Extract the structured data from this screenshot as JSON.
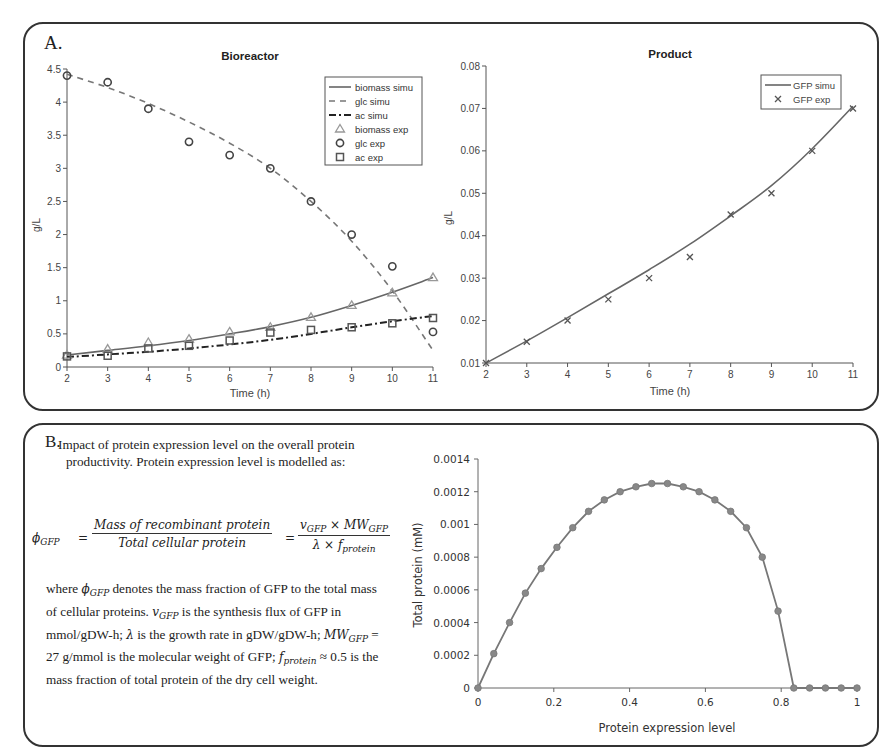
{
  "panelA": {
    "label": "A.",
    "bioreactor": {
      "title": "Bioreactor",
      "ylabel": "g/L",
      "xlabel": "Time (h)",
      "yticks": [
        "0",
        "0.5",
        "1",
        "1.5",
        "2",
        "2.5",
        "3",
        "3.5",
        "4",
        "4.5"
      ],
      "xticks": [
        "2",
        "3",
        "4",
        "5",
        "6",
        "7",
        "8",
        "9",
        "10",
        "11"
      ],
      "legend": [
        "biomass simu",
        "glc simu",
        "ac simu",
        "biomass exp",
        "glc exp",
        "ac exp"
      ]
    },
    "product": {
      "title": "Product",
      "ylabel": "g/L",
      "xlabel": "Time (h)",
      "yticks": [
        "0.01",
        "0.02",
        "0.03",
        "0.04",
        "0.05",
        "0.06",
        "0.07",
        "0.08"
      ],
      "xticks": [
        "2",
        "3",
        "4",
        "5",
        "6",
        "7",
        "8",
        "9",
        "10",
        "11"
      ],
      "legend": [
        "GFP simu",
        "GFP exp"
      ]
    }
  },
  "panelB": {
    "label": "B.",
    "intro": "Impact of protein expression level on the overall protein productivity. Protein expression level is modelled as:",
    "equation": {
      "lhs": "ϕ",
      "lhs_sub": "GFP",
      "frac1_num": "Mass of recombinant protein",
      "frac1_den": "Total cellular protein",
      "frac2_num": "v_GFP × MW_GFP",
      "frac2_den": "λ × f_protein"
    },
    "description": "where ϕGFP denotes the mass fraction of GFP to the total mass of cellular proteins. vGFP is the synthesis flux of GFP in mmol/gDW-h; λ is the growth rate in gDW/gDW-h; MWGFP = 27 g/mmol is the molecular weight of GFP; fprotein ≈ 0.5 is the mass fraction of total protein of the dry cell weight.",
    "desc_parts": {
      "p1": "where ",
      "p2": " denotes the mass fraction of GFP to the total mass of cellular proteins. ",
      "p3": " is the synthesis flux of GFP in mmol/gDW-h; ",
      "p4": " is the growth rate in gDW/gDW-h; ",
      "p5": " = 27 g/mmol is the molecular weight of GFP; ",
      "p6": " ≈ 0.5 is the mass fraction of total protein of the dry cell weight."
    },
    "chart": {
      "ylabel": "Total protein (mM)",
      "xlabel": "Protein expression level",
      "yticks": [
        "0",
        "0.0002",
        "0.0004",
        "0.0006",
        "0.0008",
        "0.001",
        "0.0012",
        "0.0014"
      ],
      "xticks": [
        "0",
        "0.2",
        "0.4",
        "0.6",
        "0.8",
        "1"
      ]
    }
  },
  "chart_data": [
    {
      "type": "line",
      "title": "Bioreactor",
      "xlabel": "Time (h)",
      "ylabel": "g/L",
      "xlim": [
        2,
        11
      ],
      "ylim": [
        0,
        4.5
      ],
      "grid": false,
      "legend_position": "upper right",
      "x": [
        2,
        3,
        4,
        5,
        6,
        7,
        8,
        9,
        10,
        11
      ],
      "series": [
        {
          "name": "biomass simu",
          "style": "solid",
          "values": [
            0.18,
            0.25,
            0.32,
            0.4,
            0.5,
            0.61,
            0.75,
            0.93,
            1.13,
            1.35
          ]
        },
        {
          "name": "glc simu",
          "style": "dashed",
          "values": [
            4.42,
            4.22,
            3.98,
            3.7,
            3.38,
            3.0,
            2.5,
            1.9,
            1.15,
            0.25
          ]
        },
        {
          "name": "ac simu",
          "style": "dash-dot",
          "values": [
            0.15,
            0.19,
            0.23,
            0.28,
            0.34,
            0.41,
            0.5,
            0.6,
            0.69,
            0.77
          ]
        },
        {
          "name": "biomass exp",
          "marker": "triangle",
          "values": [
            0.18,
            0.27,
            0.37,
            0.42,
            0.53,
            0.6,
            0.75,
            0.93,
            1.12,
            1.35
          ]
        },
        {
          "name": "glc exp",
          "marker": "circle",
          "values": [
            4.4,
            4.3,
            3.9,
            3.4,
            3.2,
            3.0,
            2.5,
            2.0,
            1.52,
            0.53
          ]
        },
        {
          "name": "ac exp",
          "marker": "square",
          "values": [
            0.16,
            0.17,
            0.28,
            0.32,
            0.4,
            0.52,
            0.56,
            0.6,
            0.66,
            0.74
          ]
        }
      ]
    },
    {
      "type": "line",
      "title": "Product",
      "xlabel": "Time (h)",
      "ylabel": "g/L",
      "xlim": [
        2,
        11
      ],
      "ylim": [
        0.01,
        0.08
      ],
      "grid": false,
      "legend_position": "upper right",
      "x": [
        2,
        3,
        4,
        5,
        6,
        7,
        8,
        9,
        10,
        11
      ],
      "series": [
        {
          "name": "GFP simu",
          "style": "solid",
          "values": [
            0.01,
            0.0152,
            0.0207,
            0.0263,
            0.032,
            0.038,
            0.0447,
            0.0518,
            0.0605,
            0.0705
          ]
        },
        {
          "name": "GFP exp",
          "marker": "x",
          "values": [
            0.01,
            0.015,
            0.02,
            0.025,
            0.03,
            0.035,
            0.045,
            0.05,
            0.06,
            0.07
          ]
        }
      ]
    },
    {
      "type": "line",
      "title": "",
      "xlabel": "Protein expression level",
      "ylabel": "Total protein (mM)",
      "xlim": [
        0,
        1
      ],
      "ylim": [
        0,
        0.0014
      ],
      "grid": false,
      "series": [
        {
          "name": "Total protein",
          "marker": "circle",
          "x": [
            0,
            0.0417,
            0.0833,
            0.125,
            0.1667,
            0.2083,
            0.25,
            0.2917,
            0.3333,
            0.375,
            0.4167,
            0.4583,
            0.5,
            0.5417,
            0.5833,
            0.625,
            0.6667,
            0.7083,
            0.75,
            0.7917,
            0.8333,
            0.875,
            0.9167,
            0.9583,
            1.0
          ],
          "values": [
            0,
            0.00021,
            0.0004,
            0.00058,
            0.00073,
            0.00086,
            0.00098,
            0.00108,
            0.00115,
            0.0012,
            0.00123,
            0.00125,
            0.00125,
            0.00123,
            0.0012,
            0.00115,
            0.00108,
            0.00098,
            0.0008,
            0.00047,
            0,
            0,
            0,
            0,
            0
          ]
        }
      ]
    }
  ]
}
